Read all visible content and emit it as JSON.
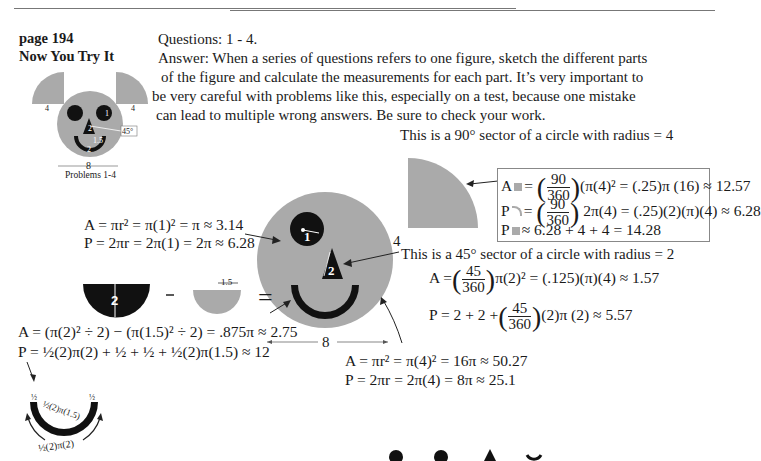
{
  "header": {
    "page": "page 194",
    "section": "Now You Try It"
  },
  "questions": "Questions:  1 - 4.",
  "answer_lines": [
    "Answer: When a series of questions refers to one figure, sketch the different parts",
    "of the figure and calculate the measurements for each part. It’s very important to",
    "be very careful with problems like this, especially on a test, because one mistake",
    "can lead to multiple wrong answers. Be sure to check your work."
  ],
  "thumbnail": {
    "ear_label_left": "4",
    "ear_label_right": "4",
    "eye_label": "1",
    "nose_label": "2",
    "angle_label": "45°",
    "smile_inner": "1.5",
    "smile_outer": "2",
    "width_label": "8",
    "caption": "Problems 1-4"
  },
  "sector90": {
    "title": "This is a 90° sector of a circle with radius = 4",
    "radius_label": "4",
    "area": {
      "lhs": "A",
      "num": "90",
      "den": "360",
      "rest": "(π(4)² = (.25)π (16) ≈ 12.57"
    },
    "arc": {
      "lhs": "P",
      "num": "90",
      "den": "360",
      "rest": "2π(4) = (.25)(2)(π)(4) ≈ 6.28"
    },
    "perimeter": {
      "lhs": "P",
      "rest": "≈ 6.28 + 4 + 4 = 14.28"
    }
  },
  "eye": {
    "label": "1",
    "area": "A = πr² = π(1)² = π ≈ 3.14",
    "perimeter": "P = 2πr = 2π(1) = 2π ≈ 6.28"
  },
  "sector45": {
    "title": "This is a 45° sector of a circle with radius = 2",
    "label": "2",
    "area": {
      "lhs": "A =",
      "num": "45",
      "den": "360",
      "rest": "π(2)² = (.125)(π)(4) ≈ 1.57"
    },
    "perimeter": {
      "lhs": "P = 2 + 2 +",
      "num": "45",
      "den": "360",
      "rest": "(2)π (2) ≈ 5.57"
    }
  },
  "smile": {
    "outer_label": "2",
    "inner_label": "1.5",
    "minus": "−",
    "equals": "=",
    "area": "A = (π(2)² ÷ 2) − (π(1.5)² ÷ 2) = .875π ≈ 2.75",
    "perimeter": "P = ½(2)π(2) + ½ + ½ + ½(2)π(1.5) ≈ 12",
    "diagram": {
      "half_left": "½",
      "half_right": "½",
      "inner_arc": "½(2)π(1.5)",
      "outer_arc": "½(2)π(2)"
    }
  },
  "face": {
    "width_label": "8",
    "area": "A = πr² = π(4)² = 16π ≈ 50.27",
    "perimeter": "P = 2πr = 2π(4) = 8π ≈ 25.1"
  },
  "colors": {
    "gray": "#aaaaaa",
    "black": "#111111",
    "text": "#1a1a1a"
  }
}
